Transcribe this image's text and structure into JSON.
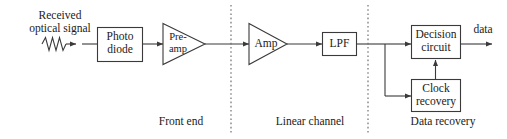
{
  "diagram": {
    "source": {
      "name": "received-optical-signal",
      "line1": "Received",
      "line2": "optical signal",
      "symbol": "wavy-signal-icon"
    },
    "blocks": [
      {
        "id": "photo-diode",
        "shape": "rect",
        "line1": "Photo",
        "line2": "diode"
      },
      {
        "id": "pre-amp",
        "shape": "triangle",
        "line1": "Pre-",
        "line2": "amp"
      },
      {
        "id": "amp",
        "shape": "triangle",
        "line1": "Amp",
        "line2": ""
      },
      {
        "id": "lpf",
        "shape": "rect",
        "line1": "LPF",
        "line2": ""
      },
      {
        "id": "decision-circuit",
        "shape": "rect",
        "line1": "Decision",
        "line2": "circuit"
      },
      {
        "id": "clock-recovery",
        "shape": "rect",
        "line1": "Clock",
        "line2": "recovery"
      }
    ],
    "output": {
      "name": "data-output",
      "label": "data"
    },
    "sections": [
      {
        "id": "front-end",
        "label": "Front end"
      },
      {
        "id": "linear-channel",
        "label": "Linear channel"
      },
      {
        "id": "data-recovery",
        "label": "Data recovery"
      }
    ],
    "dividers": [
      {
        "id": "divider-front-end-linear-channel",
        "x": 231
      },
      {
        "id": "divider-linear-channel-data-recovery",
        "x": 368
      }
    ],
    "colors": {
      "stroke": "#3a3a3a",
      "text": "#1a1a1a",
      "background": "#ffffff",
      "divider": "#6f6f6f"
    }
  }
}
